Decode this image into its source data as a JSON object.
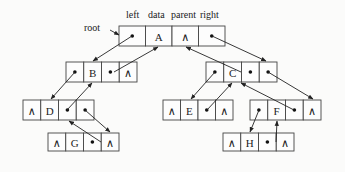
{
  "diagram": {
    "header_labels": [
      "left",
      "data",
      "parent",
      "right"
    ],
    "root_label": "root",
    "null_symbol": "∧",
    "pointer_symbol": "•",
    "nodes": [
      {
        "id": "A",
        "cells": [
          "•",
          "A",
          "∧",
          "•"
        ],
        "x": 119,
        "y": 26,
        "cell_w": 26.5,
        "h": 20
      },
      {
        "id": "B",
        "cells": [
          "•",
          "B",
          "•",
          "∧"
        ],
        "x": 66,
        "y": 62,
        "cell_w": 17.75,
        "h": 20
      },
      {
        "id": "C",
        "cells": [
          "•",
          "C",
          "•",
          "•"
        ],
        "x": 206,
        "y": 62,
        "cell_w": 17.75,
        "h": 20
      },
      {
        "id": "D",
        "cells": [
          "∧",
          "D",
          "•",
          "•"
        ],
        "x": 23,
        "y": 100,
        "cell_w": 17.75,
        "h": 20
      },
      {
        "id": "E",
        "cells": [
          "∧",
          "E",
          "•",
          "∧"
        ],
        "x": 163,
        "y": 100,
        "cell_w": 17.5,
        "h": 20
      },
      {
        "id": "F",
        "cells": [
          "•",
          "F",
          "•",
          "∧"
        ],
        "x": 250,
        "y": 100,
        "cell_w": 17.75,
        "h": 20
      },
      {
        "id": "G",
        "cells": [
          "∧",
          "G",
          "•",
          "∧"
        ],
        "x": 48,
        "y": 133,
        "cell_w": 17.75,
        "h": 18
      },
      {
        "id": "H",
        "cells": [
          "∧",
          "H",
          "•",
          "∧"
        ],
        "x": 223,
        "y": 133,
        "cell_w": 17.75,
        "h": 18
      }
    ],
    "edges": [
      {
        "from": "root",
        "to": "A",
        "kind": "root",
        "x1": 110,
        "y1": 30,
        "x2": 119,
        "y2": 35
      },
      {
        "from": "A.left",
        "to": "B",
        "kind": "child",
        "x1": 132,
        "y1": 36,
        "x2": 93,
        "y2": 61
      },
      {
        "from": "B.parent",
        "to": "A",
        "kind": "parent",
        "x1": 114,
        "y1": 72,
        "x2": 158,
        "y2": 47
      },
      {
        "from": "A.right",
        "to": "C",
        "kind": "child",
        "x1": 212,
        "y1": 36,
        "x2": 266,
        "y2": 61
      },
      {
        "from": "C.parent",
        "to": "A",
        "kind": "parent",
        "x1": 241,
        "y1": 72,
        "x2": 186,
        "y2": 47
      },
      {
        "from": "B.left",
        "to": "D",
        "kind": "child",
        "x1": 75,
        "y1": 72,
        "x2": 51,
        "y2": 99
      },
      {
        "from": "D.parent",
        "to": "B",
        "kind": "parent",
        "x1": 67,
        "y1": 110,
        "x2": 92,
        "y2": 83
      },
      {
        "from": "C.left",
        "to": "E",
        "kind": "child",
        "x1": 215,
        "y1": 72,
        "x2": 191,
        "y2": 99
      },
      {
        "from": "E.parent",
        "to": "C",
        "kind": "parent",
        "x1": 207,
        "y1": 110,
        "x2": 232,
        "y2": 83
      },
      {
        "from": "C.right",
        "to": "F",
        "kind": "child",
        "x1": 268,
        "y1": 72,
        "x2": 313,
        "y2": 99
      },
      {
        "from": "F.parent",
        "to": "C",
        "kind": "parent",
        "x1": 294,
        "y1": 110,
        "x2": 241,
        "y2": 83
      },
      {
        "from": "D.right",
        "to": "G",
        "kind": "child",
        "x1": 85,
        "y1": 110,
        "x2": 110,
        "y2": 132
      },
      {
        "from": "G.parent",
        "to": "D",
        "kind": "parent",
        "x1": 101,
        "y1": 142,
        "x2": 69,
        "y2": 121
      },
      {
        "from": "F.left",
        "to": "H",
        "kind": "child",
        "x1": 259,
        "y1": 110,
        "x2": 250,
        "y2": 132
      },
      {
        "from": "H.parent",
        "to": "F",
        "kind": "parent",
        "x1": 276,
        "y1": 142,
        "x2": 277,
        "y2": 121
      }
    ],
    "colors": {
      "line": "#222222",
      "box_stroke": "#444444",
      "background": "#fbfbfa"
    }
  }
}
